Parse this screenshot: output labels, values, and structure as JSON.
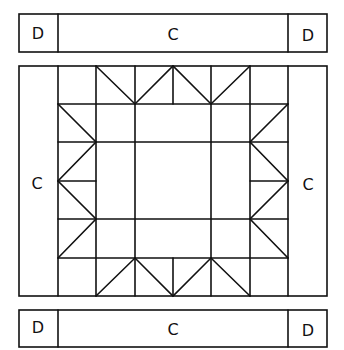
{
  "diagram": {
    "type": "quilt-block-assembly",
    "top_strip": {
      "left_label": "D",
      "center_label": "C",
      "right_label": "D"
    },
    "middle": {
      "left_label": "C",
      "right_label": "C"
    },
    "bottom_strip": {
      "left_label": "D",
      "center_label": "C",
      "right_label": "D"
    },
    "center_block": {
      "grid": "6x6",
      "pattern": "flying-geese-star"
    },
    "line_color": "#111111",
    "background": "#ffffff"
  }
}
